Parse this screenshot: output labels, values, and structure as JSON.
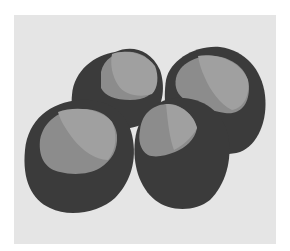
{
  "image": {
    "subject": "Four horse chestnuts (conkers) illustration",
    "count": 4,
    "style": "grayscale flat illustration"
  },
  "colors": {
    "background": "#ffffff",
    "panel": "#e5e5e5",
    "shell": "#3b3b3b",
    "shell_shadow": "#333333",
    "hilum": "#8c8c8c",
    "hilum_highlight": "#a0a0a0"
  },
  "nuts": [
    {
      "name": "back-left",
      "cx": 118,
      "cy": 92
    },
    {
      "name": "back-right",
      "cx": 218,
      "cy": 100
    },
    {
      "name": "front-left",
      "cx": 75,
      "cy": 162
    },
    {
      "name": "front-center",
      "cx": 183,
      "cy": 160
    }
  ]
}
